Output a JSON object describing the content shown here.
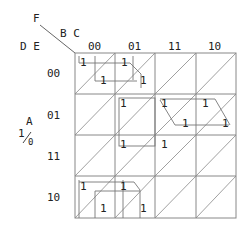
{
  "labels": {
    "f": "F",
    "bc": "B C",
    "de": "D E",
    "a": "A",
    "a_one": "1",
    "a_zero": "0"
  },
  "columns": [
    "00",
    "01",
    "11",
    "10"
  ],
  "rows": [
    "00",
    "01",
    "11",
    "10"
  ],
  "cells": {
    "r0c0_upper": "1",
    "r0c0_lower": "1",
    "r0c1_upper": "1",
    "r0c1_lower": "1",
    "r1c1_upper": "1",
    "r1c2_upper": "1",
    "r1c2_lower": "1",
    "r1c3_upper": "1",
    "r1c3_lower": "1",
    "r2c1_upper": "1",
    "r2c2_upper": "1",
    "r3c0_upper": "1",
    "r3c0_lower": "1",
    "r3c1_upper": "1",
    "r3c1_lower": "1"
  },
  "colors": {
    "grid": "#888888",
    "loop": "#777777",
    "text": "#222222"
  }
}
